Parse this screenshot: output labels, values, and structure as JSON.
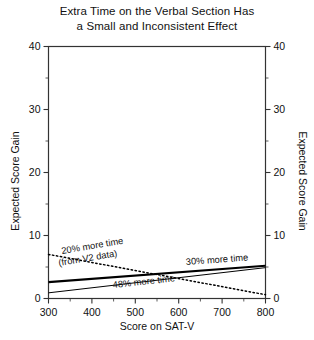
{
  "chart_data": {
    "type": "line",
    "title": "Extra Time on the Verbal Section Has a Small and Inconsistent Effect",
    "title_line1": "Extra Time on the Verbal Section Has",
    "title_line2": "a Small and Inconsistent Effect",
    "xlabel": "Score on SAT-V",
    "ylabel": "Expected Score Gain",
    "ylabel_right": "Expected Score Gain",
    "xlim": [
      300,
      800
    ],
    "ylim": [
      0,
      40
    ],
    "xticks": [
      300,
      400,
      500,
      600,
      700,
      800
    ],
    "xtick_labels": [
      "300",
      "400",
      "500",
      "600",
      "700",
      "800"
    ],
    "yticks": [
      0,
      10,
      20,
      30,
      40
    ],
    "ytick_labels": [
      "0",
      "10",
      "20",
      "30",
      "40"
    ],
    "x_minor_tick_step": 50,
    "y_minor_tick_step": 5,
    "grid": false,
    "legend_position": "inline-annotations",
    "right_axis_mirrors_left": true,
    "series": [
      {
        "name": "20% more time (from V2 data)",
        "label": "20% more time",
        "label_line2": "(from V2 data)",
        "style": "dotted",
        "color": "#000000",
        "x": [
          300,
          800
        ],
        "values": [
          7.0,
          0.6
        ]
      },
      {
        "name": "30% more time",
        "label": "30% more time",
        "style": "solid-thick",
        "color": "#000000",
        "x": [
          300,
          800
        ],
        "values": [
          2.6,
          5.2
        ]
      },
      {
        "name": "48% more time",
        "label": "48% more time",
        "style": "solid-thin",
        "color": "#000000",
        "x": [
          300,
          800
        ],
        "values": [
          0.9,
          4.9
        ]
      }
    ]
  }
}
